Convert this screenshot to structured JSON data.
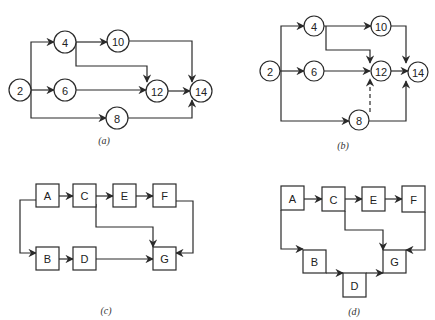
{
  "figure": {
    "stroke_color": "#2a2a2a",
    "panels": [
      {
        "id": "a",
        "caption": "(a)",
        "caption_pos": [
          104,
          140
        ],
        "node_shape": "circle",
        "radius": 11,
        "nodes": [
          {
            "id": "2",
            "label": "2",
            "x": 20,
            "y": 90
          },
          {
            "id": "4",
            "label": "4",
            "x": 65,
            "y": 42
          },
          {
            "id": "6",
            "label": "6",
            "x": 65,
            "y": 90
          },
          {
            "id": "10",
            "label": "10",
            "x": 118,
            "y": 41
          },
          {
            "id": "12",
            "label": "12",
            "x": 157,
            "y": 91
          },
          {
            "id": "8",
            "label": "8",
            "x": 117,
            "y": 118
          },
          {
            "id": "14",
            "label": "14",
            "x": 201,
            "y": 91
          }
        ],
        "edges": [
          {
            "from": "2",
            "to": "4",
            "dashed": false,
            "points": [
              [
                31,
                90
              ],
              [
                31,
                42
              ],
              [
                54,
                42
              ]
            ]
          },
          {
            "from": "2",
            "to": "6",
            "dashed": false,
            "points": [
              [
                31,
                90
              ],
              [
                54,
                90
              ]
            ]
          },
          {
            "from": "2",
            "to": "8",
            "dashed": false,
            "points": [
              [
                31,
                90
              ],
              [
                31,
                118
              ],
              [
                106,
                118
              ]
            ]
          },
          {
            "from": "4",
            "to": "10",
            "dashed": false,
            "points": [
              [
                76,
                42
              ],
              [
                107,
                42
              ]
            ]
          },
          {
            "from": "4",
            "to": "12",
            "dashed": false,
            "points": [
              [
                76,
                42
              ],
              [
                76,
                66
              ],
              [
                147,
                66
              ],
              [
                147,
                82
              ]
            ]
          },
          {
            "from": "6",
            "to": "12",
            "dashed": false,
            "points": [
              [
                76,
                90
              ],
              [
                146,
                90
              ]
            ]
          },
          {
            "from": "10",
            "to": "14",
            "dashed": false,
            "points": [
              [
                129,
                41
              ],
              [
                192,
                41
              ],
              [
                192,
                82
              ]
            ]
          },
          {
            "from": "12",
            "to": "14",
            "dashed": false,
            "points": [
              [
                168,
                91
              ],
              [
                190,
                91
              ]
            ]
          },
          {
            "from": "8",
            "to": "14",
            "dashed": false,
            "points": [
              [
                128,
                118
              ],
              [
                192,
                118
              ],
              [
                192,
                100
              ]
            ]
          }
        ]
      },
      {
        "id": "b",
        "caption": "(b)",
        "caption_pos": [
          343,
          145
        ],
        "node_shape": "circle",
        "radius": 10,
        "nodes": [
          {
            "id": "2",
            "label": "2",
            "x": 270,
            "y": 71
          },
          {
            "id": "4",
            "label": "4",
            "x": 314,
            "y": 26
          },
          {
            "id": "6",
            "label": "6",
            "x": 314,
            "y": 71
          },
          {
            "id": "10",
            "label": "10",
            "x": 381,
            "y": 26
          },
          {
            "id": "12",
            "label": "12",
            "x": 381,
            "y": 71
          },
          {
            "id": "8",
            "label": "8",
            "x": 359,
            "y": 120
          },
          {
            "id": "14",
            "label": "14",
            "x": 418,
            "y": 72
          }
        ],
        "edges": [
          {
            "from": "2",
            "to": "4",
            "dashed": false,
            "points": [
              [
                281,
                71
              ],
              [
                281,
                26
              ],
              [
                304,
                26
              ]
            ]
          },
          {
            "from": "2",
            "to": "6",
            "dashed": false,
            "points": [
              [
                280,
                71
              ],
              [
                304,
                71
              ]
            ]
          },
          {
            "from": "2",
            "to": "8",
            "dashed": false,
            "points": [
              [
                281,
                71
              ],
              [
                281,
                121
              ],
              [
                349,
                121
              ]
            ]
          },
          {
            "from": "4",
            "to": "10",
            "dashed": false,
            "points": [
              [
                324,
                26
              ],
              [
                371,
                26
              ]
            ]
          },
          {
            "from": "4",
            "to": "12",
            "dashed": false,
            "points": [
              [
                326,
                26
              ],
              [
                326,
                50
              ],
              [
                370,
                50
              ],
              [
                370,
                63
              ]
            ]
          },
          {
            "from": "6",
            "to": "12",
            "dashed": false,
            "points": [
              [
                324,
                71
              ],
              [
                370,
                71
              ]
            ]
          },
          {
            "from": "10",
            "to": "14",
            "dashed": false,
            "points": [
              [
                391,
                26
              ],
              [
                406,
                26
              ],
              [
                406,
                63
              ]
            ]
          },
          {
            "from": "12",
            "to": "14",
            "dashed": false,
            "points": [
              [
                391,
                71
              ],
              [
                408,
                71
              ]
            ]
          },
          {
            "from": "8",
            "to": "14",
            "dashed": false,
            "points": [
              [
                369,
                121
              ],
              [
                406,
                121
              ],
              [
                406,
                81
              ]
            ]
          },
          {
            "from": "8",
            "to": "12",
            "dashed": true,
            "points": [
              [
                370,
                112
              ],
              [
                370,
                79
              ]
            ]
          }
        ]
      },
      {
        "id": "c",
        "caption": "(c)",
        "caption_pos": [
          106,
          310
        ],
        "node_shape": "box",
        "nodes": [
          {
            "id": "A",
            "label": "A",
            "x": 36,
            "y": 184,
            "w": 23,
            "h": 23
          },
          {
            "id": "C",
            "label": "C",
            "x": 73,
            "y": 184,
            "w": 23,
            "h": 23
          },
          {
            "id": "E",
            "label": "E",
            "x": 113,
            "y": 184,
            "w": 23,
            "h": 23
          },
          {
            "id": "F",
            "label": "F",
            "x": 153,
            "y": 184,
            "w": 23,
            "h": 23
          },
          {
            "id": "B",
            "label": "B",
            "x": 36,
            "y": 247,
            "w": 23,
            "h": 23
          },
          {
            "id": "D",
            "label": "D",
            "x": 73,
            "y": 247,
            "w": 23,
            "h": 23
          },
          {
            "id": "G",
            "label": "G",
            "x": 153,
            "y": 247,
            "w": 23,
            "h": 23
          }
        ],
        "edges": [
          {
            "from": "A",
            "to": "C",
            "dashed": false,
            "points": [
              [
                59,
                196
              ],
              [
                73,
                196
              ]
            ]
          },
          {
            "from": "C",
            "to": "E",
            "dashed": false,
            "points": [
              [
                96,
                196
              ],
              [
                113,
                196
              ]
            ]
          },
          {
            "from": "E",
            "to": "F",
            "dashed": false,
            "points": [
              [
                136,
                196
              ],
              [
                153,
                196
              ]
            ]
          },
          {
            "from": "A",
            "to": "B",
            "dashed": false,
            "points": [
              [
                36,
                200
              ],
              [
                20,
                200
              ],
              [
                20,
                253
              ],
              [
                36,
                253
              ]
            ]
          },
          {
            "from": "B",
            "to": "D",
            "dashed": false,
            "points": [
              [
                59,
                259
              ],
              [
                73,
                259
              ]
            ]
          },
          {
            "from": "D",
            "to": "G",
            "dashed": false,
            "points": [
              [
                96,
                259
              ],
              [
                153,
                259
              ]
            ]
          },
          {
            "from": "C",
            "to": "G",
            "dashed": false,
            "points": [
              [
                96,
                204
              ],
              [
                96,
                227
              ],
              [
                153,
                227
              ],
              [
                153,
                247
              ]
            ]
          },
          {
            "from": "F",
            "to": "G",
            "dashed": false,
            "points": [
              [
                176,
                201
              ],
              [
                193,
                201
              ],
              [
                193,
                253
              ],
              [
                176,
                253
              ]
            ]
          }
        ]
      },
      {
        "id": "d",
        "caption": "(d)",
        "caption_pos": [
          354,
          311
        ],
        "node_shape": "box",
        "nodes": [
          {
            "id": "A",
            "label": "A",
            "x": 281,
            "y": 186,
            "w": 23,
            "h": 24
          },
          {
            "id": "C",
            "label": "C",
            "x": 322,
            "y": 187,
            "w": 23,
            "h": 24
          },
          {
            "id": "E",
            "label": "E",
            "x": 362,
            "y": 187,
            "w": 23,
            "h": 24
          },
          {
            "id": "F",
            "label": "F",
            "x": 402,
            "y": 186,
            "w": 23,
            "h": 26
          },
          {
            "id": "B",
            "label": "B",
            "x": 303,
            "y": 250,
            "w": 23,
            "h": 23
          },
          {
            "id": "D",
            "label": "D",
            "x": 343,
            "y": 273,
            "w": 23,
            "h": 24
          },
          {
            "id": "G",
            "label": "G",
            "x": 383,
            "y": 250,
            "w": 23,
            "h": 23
          }
        ],
        "edges": [
          {
            "from": "A",
            "to": "C",
            "dashed": false,
            "points": [
              [
                304,
                199
              ],
              [
                322,
                199
              ]
            ]
          },
          {
            "from": "C",
            "to": "E",
            "dashed": false,
            "points": [
              [
                345,
                199
              ],
              [
                362,
                199
              ]
            ]
          },
          {
            "from": "E",
            "to": "F",
            "dashed": false,
            "points": [
              [
                385,
                199
              ],
              [
                402,
                199
              ]
            ]
          },
          {
            "from": "A",
            "to": "B",
            "dashed": false,
            "points": [
              [
                281,
                210
              ],
              [
                281,
                249
              ],
              [
                303,
                249
              ]
            ]
          },
          {
            "from": "B",
            "to": "D",
            "dashed": false,
            "points": [
              [
                326,
                273
              ],
              [
                343,
                273
              ]
            ]
          },
          {
            "from": "D",
            "to": "G",
            "dashed": false,
            "points": [
              [
                366,
                273
              ],
              [
                383,
                273
              ]
            ]
          },
          {
            "from": "C",
            "to": "G",
            "dashed": false,
            "points": [
              [
                345,
                211
              ],
              [
                345,
                230
              ],
              [
                383,
                230
              ],
              [
                383,
                250
              ]
            ]
          },
          {
            "from": "F",
            "to": "G",
            "dashed": false,
            "points": [
              [
                425,
                212
              ],
              [
                425,
                250
              ],
              [
                406,
                250
              ]
            ]
          }
        ]
      }
    ]
  }
}
